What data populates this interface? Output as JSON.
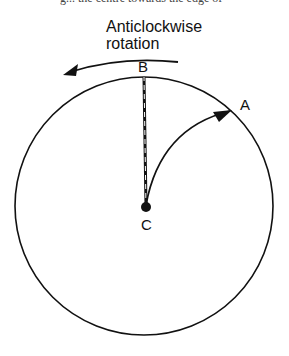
{
  "page": {
    "cut_text": "g... the centre towards the edge of"
  },
  "diagram": {
    "title_line1": "Anticlockwise",
    "title_line2": "rotation",
    "labels": {
      "a": "A",
      "b": "B",
      "c": "C"
    },
    "colors": {
      "stroke": "#111111",
      "background": "#ffffff"
    }
  }
}
